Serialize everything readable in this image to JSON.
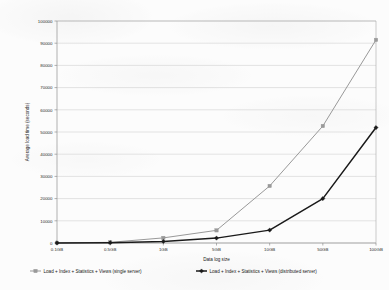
{
  "chart_data": {
    "type": "line",
    "title": "",
    "xlabel": "Data log size",
    "ylabel": "Average load time (seconds)",
    "categories": [
      "0.1GB",
      "0.5GB",
      "1GB",
      "5GB",
      "10GB",
      "50GB",
      "100GB"
    ],
    "ylim": [
      0,
      100000
    ],
    "ytick_labels": [
      "0",
      "10000",
      "20000",
      "30000",
      "40000",
      "50000",
      "60000",
      "70000",
      "80000",
      "90000",
      "100000"
    ],
    "ytick_values": [
      0,
      10000,
      20000,
      30000,
      40000,
      50000,
      60000,
      70000,
      80000,
      90000,
      100000
    ],
    "grid": true,
    "legend_position": "bottom",
    "series": [
      {
        "name": "Load + Index + Statistics + Views (single server)",
        "color": "#999999",
        "marker": "square",
        "values": [
          100,
          300,
          2300,
          5700,
          25700,
          52700,
          91500
        ]
      },
      {
        "name": "Load + Index + Statistics + Views (distributed server)",
        "color": "#1a1a1a",
        "marker": "diamond",
        "values": [
          50,
          150,
          700,
          2200,
          5800,
          20000,
          52000
        ]
      }
    ]
  },
  "legend": {
    "items": [
      {
        "label": "Load + Index + Statistics + Views (single server)",
        "marker_name": "legend-marker-single-server"
      },
      {
        "label": "Load + Index + Statistics + Views (distributed server)",
        "marker_name": "legend-marker-distributed-server"
      }
    ]
  }
}
